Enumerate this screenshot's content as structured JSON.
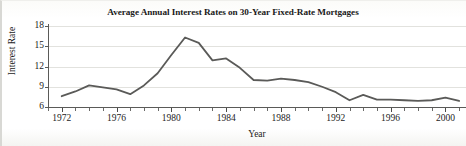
{
  "chart_data": {
    "type": "line",
    "title": "Average Annual Interest Rates on 30-Year Fixed-Rate Mortgages",
    "xlabel": "Year",
    "ylabel": "Interest Rate",
    "xlim": [
      1971,
      2001.5
    ],
    "ylim": [
      6,
      18
    ],
    "grid": true,
    "legend": "none",
    "yticks": [
      6,
      9,
      12,
      15,
      18
    ],
    "ytick_labels": [
      "6",
      "9",
      "12",
      "15",
      "18"
    ],
    "xticks": [
      1972,
      1976,
      1980,
      1984,
      1988,
      1992,
      1996,
      2000
    ],
    "xtick_labels": [
      "1972",
      "1976",
      "1980",
      "1984",
      "1988",
      "1992",
      "1996",
      "2000"
    ],
    "x_minor_tick_interval": 1,
    "line_color": "#5a5a58",
    "line_width": 1.8,
    "x": [
      1972,
      1973,
      1974,
      1975,
      1976,
      1977,
      1978,
      1979,
      1980,
      1981,
      1982,
      1983,
      1984,
      1985,
      1986,
      1987,
      1988,
      1989,
      1990,
      1991,
      1992,
      1993,
      1994,
      1995,
      1996,
      1997,
      1998,
      1999,
      2000,
      2001
    ],
    "values": [
      7.6,
      8.3,
      9.2,
      8.9,
      8.6,
      7.9,
      9.2,
      11.0,
      13.7,
      16.3,
      15.5,
      12.9,
      13.2,
      11.8,
      10.0,
      9.9,
      10.2,
      10.0,
      9.7,
      9.0,
      8.2,
      7.0,
      7.8,
      7.1,
      7.1,
      7.0,
      6.9,
      7.0,
      7.4,
      6.9
    ],
    "units": "percent"
  },
  "figure": {
    "title": "Average Annual Interest Rates on 30-Year Fixed-Rate Mortgages",
    "y_axis_title": "Interest Rate",
    "x_axis_title": "Year"
  }
}
